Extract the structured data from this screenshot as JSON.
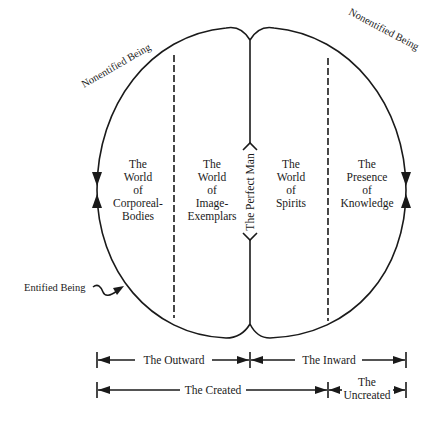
{
  "diagram": {
    "arc_labels": {
      "top_left": "Nonentified Being",
      "top_right": "Nonentified Being",
      "bottom_left": "Entified Being"
    },
    "center_axis_label": "The Perfect Man",
    "regions": [
      {
        "lines": [
          "The",
          "World",
          "of",
          "Corporeal-",
          "Bodies"
        ]
      },
      {
        "lines": [
          "The",
          "World",
          "of",
          "Image-",
          "Exemplars"
        ]
      },
      {
        "lines": [
          "The",
          "World",
          "of",
          "Spirits"
        ]
      },
      {
        "lines": [
          "The",
          "Presence",
          "of",
          "Knowledge"
        ]
      }
    ],
    "spans": {
      "row1": [
        {
          "label": "The Outward"
        },
        {
          "label": "The Inward"
        }
      ],
      "row2": [
        {
          "label": "The Created"
        },
        {
          "label_line1": "The",
          "label_line2": "Uncreated"
        }
      ]
    },
    "colors": {
      "ink": "#1a1a1a",
      "background": "#ffffff"
    }
  }
}
